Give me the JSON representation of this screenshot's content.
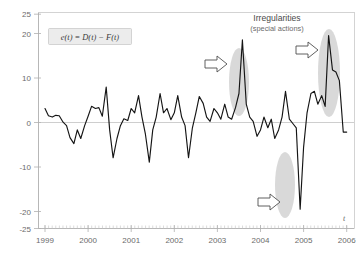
{
  "figure": {
    "width": 361,
    "height": 260,
    "background": "#ffffff",
    "frame_color": "#c9c9c9"
  },
  "equation_box": {
    "text": "e(t) = D(t) − F(t)",
    "fill": "#ececec",
    "border": "#c4c4c4"
  },
  "annotation": {
    "title": "Irregularities",
    "subtitle": "(special actions)",
    "arrow_fill": "#ffffff",
    "arrow_stroke": "#4f4f4f",
    "highlight_color": "#b9b9b9",
    "callouts": [
      {
        "name": "positive-spike-2003",
        "target_year": 2003.62,
        "target_value": 19.0,
        "direction": "right"
      },
      {
        "name": "positive-spike-2005",
        "target_year": 2005.72,
        "target_value": 20.0,
        "direction": "right"
      },
      {
        "name": "negative-spike-2004",
        "target_year": 2004.92,
        "target_value": -20.5,
        "direction": "right"
      }
    ]
  },
  "axis_variable_label": "t",
  "chart_data": {
    "type": "line",
    "title": "",
    "subtitle": "",
    "xlabel": "t",
    "ylabel": "",
    "grid": false,
    "legend_position": "none",
    "line_color": "#151515",
    "xlim": [
      1999,
      2006
    ],
    "ylim": [
      -25,
      25
    ],
    "ytick_labels": [
      "25",
      "20",
      "10",
      "0",
      "-10",
      "-20",
      "-25"
    ],
    "yticks": [
      25,
      20,
      10,
      0,
      -10,
      -20,
      -25
    ],
    "xtick_labels": [
      "1999",
      "2000",
      "2001",
      "2002",
      "2003",
      "2004",
      "2005",
      "2006"
    ],
    "xticks": [
      1999,
      2000,
      2001,
      2002,
      2003,
      2004,
      2005,
      2006
    ],
    "minor_ticks_per_year": 12,
    "series": [
      {
        "name": "e(t)",
        "x": [
          1999.0,
          1999.08,
          1999.17,
          1999.25,
          1999.33,
          1999.42,
          1999.5,
          1999.58,
          1999.67,
          1999.75,
          1999.83,
          1999.92,
          2000.0,
          2000.08,
          2000.17,
          2000.25,
          2000.33,
          2000.42,
          2000.5,
          2000.58,
          2000.67,
          2000.75,
          2000.83,
          2000.92,
          2001.0,
          2001.08,
          2001.17,
          2001.25,
          2001.33,
          2001.42,
          2001.5,
          2001.58,
          2001.67,
          2001.75,
          2001.83,
          2001.92,
          2002.0,
          2002.08,
          2002.17,
          2002.25,
          2002.33,
          2002.42,
          2002.5,
          2002.58,
          2002.67,
          2002.75,
          2002.83,
          2002.92,
          2003.0,
          2003.08,
          2003.17,
          2003.25,
          2003.33,
          2003.42,
          2003.5,
          2003.58,
          2003.67,
          2003.75,
          2003.83,
          2003.92,
          2004.0,
          2004.08,
          2004.17,
          2004.25,
          2004.33,
          2004.42,
          2004.5,
          2004.58,
          2004.67,
          2004.75,
          2004.83,
          2004.92,
          2005.0,
          2005.08,
          2005.17,
          2005.25,
          2005.33,
          2005.42,
          2005.5,
          2005.58,
          2005.67,
          2005.75,
          2005.83,
          2005.92,
          2006.0
        ],
        "values": [
          3.0,
          1.3,
          1.0,
          1.4,
          1.3,
          -0.2,
          -1.0,
          -3.8,
          -5.2,
          -2.0,
          -4.0,
          -1.0,
          1.2,
          3.5,
          3.0,
          3.2,
          1.2,
          8.0,
          -2.0,
          -8.5,
          -4.0,
          -1.0,
          0.6,
          0.2,
          3.0,
          2.0,
          6.0,
          1.0,
          -3.0,
          -9.5,
          -2.0,
          1.0,
          6.5,
          2.0,
          3.0,
          0.4,
          2.0,
          6.0,
          1.0,
          -1.0,
          -8.5,
          -1.5,
          2.0,
          5.8,
          4.2,
          1.0,
          0.0,
          3.0,
          2.0,
          0.5,
          4.0,
          1.0,
          0.5,
          3.2,
          6.5,
          19.0,
          4.0,
          1.0,
          0.0,
          -3.5,
          -2.0,
          1.0,
          -1.5,
          0.5,
          -4.0,
          -2.0,
          1.0,
          7.0,
          0.5,
          -0.5,
          -1.5,
          -20.5,
          -6.0,
          2.0,
          6.5,
          7.0,
          4.0,
          6.0,
          3.5,
          20.0,
          12.0,
          11.5,
          9.5,
          -2.5,
          -2.5
        ]
      }
    ]
  }
}
